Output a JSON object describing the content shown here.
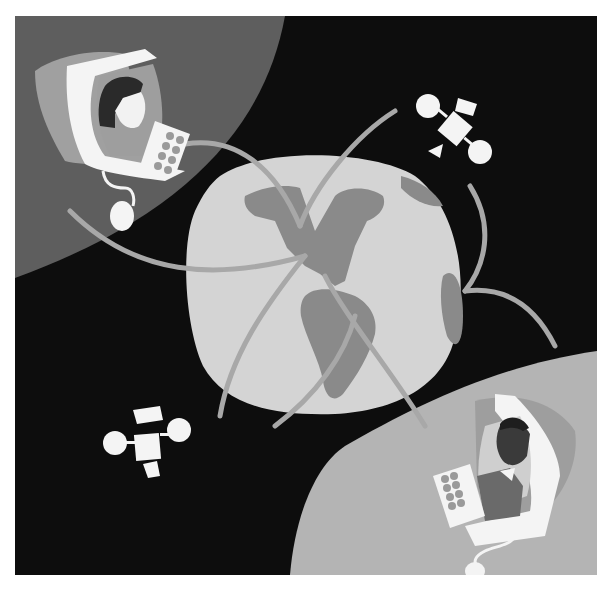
{
  "illustration": {
    "title": "Global online communication illustration",
    "elements": {
      "background": "dark-space",
      "top_left_figure": "woman-at-computer",
      "bottom_right_figure": "man-at-computer",
      "center": "globe-americas",
      "satellites": 2,
      "arcs": "connection-arcs"
    },
    "colors": {
      "space": "#0d0d0d",
      "top_left_planet": "#5e5e5e",
      "bottom_right_planet": "#b4b4b4",
      "globe_ocean": "#d4d4d4",
      "globe_land": "#8a8a8a",
      "arc": "#a8a8a8",
      "white": "#f4f4f4",
      "monitor_shadow_tl": "#a0a0a0",
      "monitor_shadow_br": "#9e9e9e",
      "skin_light": "#f2f2f2",
      "hair_dark": "#2a2a2a",
      "skin_dark": "#3a3a3a",
      "shirt_dark": "#6a6a6a",
      "keypad_dots": "#9a9a9a"
    }
  }
}
